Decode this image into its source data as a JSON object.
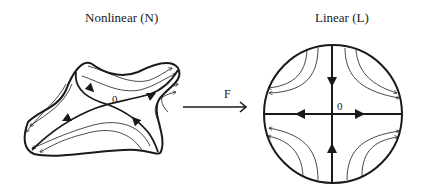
{
  "diagram": {
    "left_panel": {
      "title": "Nonlinear (N)",
      "origin_label": "0",
      "description": "Deformed blob domain with saddle flow lines crossing at origin"
    },
    "mapping": {
      "label": "F",
      "direction": "left-to-right"
    },
    "right_panel": {
      "title": "Linear (L)",
      "origin_label": "0",
      "description": "Circular domain with linear saddle phase portrait; stable manifold vertical (inward), unstable manifold horizontal (outward)"
    },
    "colors": {
      "stroke": "#1a1a1a",
      "background": "#ffffff"
    }
  }
}
